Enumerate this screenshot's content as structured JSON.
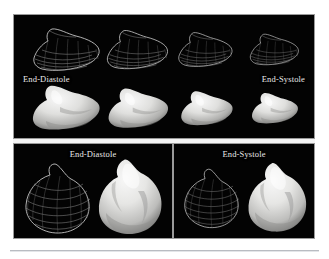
{
  "figure": {
    "background_color": "#ffffff",
    "panel_color": "#030303",
    "label_color": "#e9e9e9",
    "border_color": "#9a9a9a"
  },
  "top_panel": {
    "name": "time-sequence-panel",
    "label_left": "End-Diastole",
    "label_right": "End-Systole",
    "frames": [
      {
        "phase": "End-Diastole",
        "index": 1,
        "scale": 1.0
      },
      {
        "phase": "Mid-Systole",
        "index": 2,
        "scale": 0.9
      },
      {
        "phase": "Mid-Systole",
        "index": 3,
        "scale": 0.8
      },
      {
        "phase": "End-Systole",
        "index": 4,
        "scale": 0.7
      }
    ],
    "row_top_type": "wireframe-mesh",
    "row_bottom_type": "shaded-surface"
  },
  "bottom_left_panel": {
    "name": "end-diastole-detail-panel",
    "label": "End-Diastole",
    "left_object_type": "wireframe-mesh",
    "right_object_type": "shaded-surface"
  },
  "bottom_right_panel": {
    "name": "end-systole-detail-panel",
    "label": "End-Systole",
    "left_object_type": "wireframe-mesh",
    "right_object_type": "shaded-surface"
  }
}
